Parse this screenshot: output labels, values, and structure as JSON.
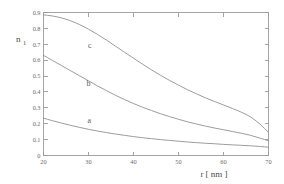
{
  "chart_data": {
    "type": "line",
    "title": "",
    "subtitle": "",
    "xlabel": "r  [ nm ]",
    "ylabel": "n",
    "ylabel_subscript": "1",
    "xlim": [
      20,
      70
    ],
    "ylim": [
      0,
      0.9
    ],
    "grid": false,
    "legend_position": "inline-curve-labels",
    "xticks": [
      20,
      30,
      40,
      50,
      60,
      70
    ],
    "xtick_labels": [
      "20",
      "30",
      "40",
      "50",
      "60",
      "70"
    ],
    "yticks": [
      0,
      0.1,
      0.2,
      0.3,
      0.4,
      0.5,
      0.6,
      0.7,
      0.8,
      0.9
    ],
    "ytick_labels": [
      "0",
      "0.1",
      "0.2",
      "0.3",
      "0.4",
      "0.5",
      "0.6",
      "0.7",
      "0.8",
      "0.9"
    ],
    "x": [
      20,
      22,
      24,
      26,
      28,
      30,
      32,
      34,
      36,
      38,
      40,
      42,
      44,
      46,
      48,
      50,
      52,
      54,
      56,
      58,
      60,
      62,
      64,
      66,
      68,
      70
    ],
    "series": [
      {
        "name": "a",
        "label": "a",
        "label_x": 30.2,
        "label_y": 0.203,
        "color": "#8a8a8a",
        "values": [
          0.235,
          0.219,
          0.204,
          0.19,
          0.177,
          0.165,
          0.154,
          0.144,
          0.135,
          0.127,
          0.119,
          0.112,
          0.106,
          0.1,
          0.095,
          0.09,
          0.085,
          0.081,
          0.077,
          0.074,
          0.07,
          0.067,
          0.064,
          0.061,
          0.057,
          0.052
        ]
      },
      {
        "name": "b",
        "label": "b",
        "label_x": 30.0,
        "label_y": 0.437,
        "color": "#8a8a8a",
        "values": [
          0.63,
          0.598,
          0.566,
          0.534,
          0.502,
          0.47,
          0.438,
          0.408,
          0.379,
          0.352,
          0.327,
          0.304,
          0.283,
          0.263,
          0.245,
          0.228,
          0.212,
          0.198,
          0.185,
          0.173,
          0.162,
          0.151,
          0.14,
          0.127,
          0.11,
          0.093
        ]
      },
      {
        "name": "c",
        "label": "c",
        "label_x": 30.3,
        "label_y": 0.676,
        "color": "#8a8a8a",
        "values": [
          0.885,
          0.878,
          0.866,
          0.848,
          0.824,
          0.795,
          0.762,
          0.726,
          0.688,
          0.65,
          0.612,
          0.575,
          0.539,
          0.505,
          0.473,
          0.443,
          0.414,
          0.388,
          0.363,
          0.34,
          0.318,
          0.296,
          0.272,
          0.243,
          0.2,
          0.145
        ]
      }
    ]
  }
}
